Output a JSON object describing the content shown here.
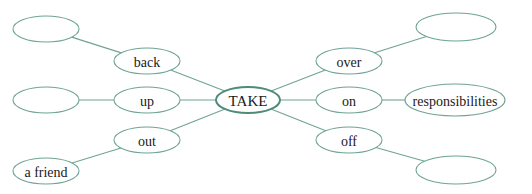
{
  "diagram": {
    "title": "",
    "center": {
      "id": "take",
      "label": "TAKE",
      "cx": 248,
      "cy": 100,
      "rx": 32,
      "ry": 13
    },
    "particles": [
      {
        "id": "back",
        "label": "back",
        "cx": 147,
        "cy": 61,
        "rx": 33,
        "ry": 13
      },
      {
        "id": "up",
        "label": "up",
        "cx": 147,
        "cy": 100,
        "rx": 33,
        "ry": 13
      },
      {
        "id": "out",
        "label": "out",
        "cx": 147,
        "cy": 140,
        "rx": 33,
        "ry": 13
      },
      {
        "id": "over",
        "label": "over",
        "cx": 349,
        "cy": 61,
        "rx": 33,
        "ry": 13
      },
      {
        "id": "on",
        "label": "on",
        "cx": 349,
        "cy": 100,
        "rx": 33,
        "ry": 13
      },
      {
        "id": "off",
        "label": "off",
        "cx": 349,
        "cy": 140,
        "rx": 33,
        "ry": 13
      }
    ],
    "objects": [
      {
        "id": "back-obj",
        "label": "",
        "parent": "back",
        "cx": 46,
        "cy": 29,
        "rx": 33,
        "ry": 13
      },
      {
        "id": "up-obj",
        "label": "",
        "parent": "up",
        "cx": 46,
        "cy": 100,
        "rx": 33,
        "ry": 13
      },
      {
        "id": "out-obj",
        "label": "a friend",
        "parent": "out",
        "cx": 46,
        "cy": 171,
        "rx": 33,
        "ry": 13
      },
      {
        "id": "over-obj",
        "label": "",
        "parent": "over",
        "cx": 456,
        "cy": 27,
        "rx": 40,
        "ry": 14
      },
      {
        "id": "on-obj",
        "label": "responsibilities",
        "parent": "on",
        "cx": 455,
        "cy": 100,
        "rx": 50,
        "ry": 16
      },
      {
        "id": "off-obj",
        "label": "",
        "parent": "off",
        "cx": 456,
        "cy": 170,
        "rx": 40,
        "ry": 14
      }
    ],
    "colors": {
      "stroke": "#6fa396",
      "center_stroke": "#4f8a7a",
      "text": "#1a1a1a"
    }
  }
}
